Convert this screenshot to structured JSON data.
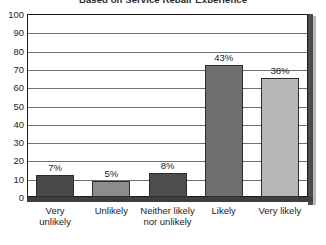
{
  "chart_data": {
    "type": "bar",
    "title": "Based on Service Repair Experience",
    "xlabel": "",
    "ylabel": "",
    "ylim": [
      0,
      100
    ],
    "ytick_step": 10,
    "yticks": [
      100,
      90,
      80,
      70,
      60,
      50,
      40,
      30,
      20,
      10,
      0
    ],
    "grid": true,
    "legend": "none",
    "categories": [
      "Very unlikely",
      "Unlikely",
      "Neither likely nor unlikely",
      "Likely",
      "Very likely"
    ],
    "category_lines": [
      [
        "Very",
        "unlikely"
      ],
      [
        "Unlikely"
      ],
      [
        "Neither likely",
        "nor unlikely"
      ],
      [
        "Likely"
      ],
      [
        "Very likely"
      ]
    ],
    "values": [
      12,
      9,
      13,
      72,
      65
    ],
    "data_labels": [
      "7%",
      "5%",
      "8%",
      "43%",
      "38%"
    ],
    "bar_colors": [
      "#4a4a4a",
      "#8c8c8c",
      "#4d4d4d",
      "#6f6f6f",
      "#b7b7b7"
    ],
    "bar_border_color": "#2b2b2b",
    "plot_border_color": "#1a1a1a",
    "gridline_color": "#6f6f6f",
    "baseline_color": "#3f3f3f",
    "background_color": "#ffffff",
    "text_color": "#1d1d1d"
  }
}
